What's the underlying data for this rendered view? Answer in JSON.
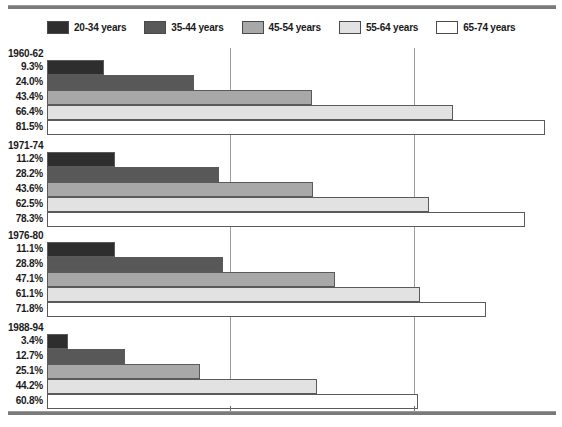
{
  "chart_data": {
    "type": "bar",
    "orientation": "horizontal",
    "title": "",
    "xlabel": "",
    "ylabel": "",
    "xlim": [
      0,
      85
    ],
    "grid": true,
    "gridlines": [
      30,
      60
    ],
    "legend_position": "top",
    "legend": [
      {
        "label": "20-34 years",
        "color": "#2e2e2e"
      },
      {
        "label": "35-44 years",
        "color": "#585858"
      },
      {
        "label": "45-54 years",
        "color": "#a8a8a8"
      },
      {
        "label": "55-64 years",
        "color": "#e2e2e2"
      },
      {
        "label": "65-74 years",
        "color": "#ffffff"
      }
    ],
    "categories": [
      "1960-62",
      "1971-74",
      "1976-80",
      "1988-94"
    ],
    "series": [
      {
        "name": "20-34 years",
        "color": "#2e2e2e",
        "values": [
          9.3,
          11.2,
          11.1,
          3.4
        ]
      },
      {
        "name": "35-44 years",
        "color": "#585858",
        "values": [
          24.0,
          28.2,
          28.8,
          12.7
        ]
      },
      {
        "name": "45-54 years",
        "color": "#a8a8a8",
        "values": [
          43.4,
          43.6,
          47.1,
          25.1
        ]
      },
      {
        "name": "55-64 years",
        "color": "#e2e2e2",
        "values": [
          66.4,
          62.5,
          61.1,
          44.2
        ]
      },
      {
        "name": "65-74 years",
        "color": "#ffffff",
        "values": [
          81.5,
          78.3,
          71.8,
          60.8
        ]
      }
    ],
    "groups": [
      {
        "title": "1960-62",
        "rows": [
          {
            "label": "9.3%",
            "value": 9.3,
            "color": "#2e2e2e"
          },
          {
            "label": "24.0%",
            "value": 24.0,
            "color": "#585858"
          },
          {
            "label": "43.4%",
            "value": 43.4,
            "color": "#a8a8a8"
          },
          {
            "label": "66.4%",
            "value": 66.4,
            "color": "#e2e2e2"
          },
          {
            "label": "81.5%",
            "value": 81.5,
            "color": "#ffffff"
          }
        ]
      },
      {
        "title": "1971-74",
        "rows": [
          {
            "label": "11.2%",
            "value": 11.2,
            "color": "#2e2e2e"
          },
          {
            "label": "28.2%",
            "value": 28.2,
            "color": "#585858"
          },
          {
            "label": "43.6%",
            "value": 43.6,
            "color": "#a8a8a8"
          },
          {
            "label": "62.5%",
            "value": 62.5,
            "color": "#e2e2e2"
          },
          {
            "label": "78.3%",
            "value": 78.3,
            "color": "#ffffff"
          }
        ]
      },
      {
        "title": "1976-80",
        "rows": [
          {
            "label": "11.1%",
            "value": 11.1,
            "color": "#2e2e2e"
          },
          {
            "label": "28.8%",
            "value": 28.8,
            "color": "#585858"
          },
          {
            "label": "47.1%",
            "value": 47.1,
            "color": "#a8a8a8"
          },
          {
            "label": "61.1%",
            "value": 61.1,
            "color": "#e2e2e2"
          },
          {
            "label": "71.8%",
            "value": 71.8,
            "color": "#ffffff"
          }
        ]
      },
      {
        "title": "1988-94",
        "rows": [
          {
            "label": "3.4%",
            "value": 3.4,
            "color": "#2e2e2e"
          },
          {
            "label": "12.7%",
            "value": 12.7,
            "color": "#585858"
          },
          {
            "label": "25.1%",
            "value": 25.1,
            "color": "#a8a8a8"
          },
          {
            "label": "44.2%",
            "value": 44.2,
            "color": "#e2e2e2"
          },
          {
            "label": "60.8%",
            "value": 60.8,
            "color": "#ffffff"
          }
        ]
      }
    ]
  }
}
